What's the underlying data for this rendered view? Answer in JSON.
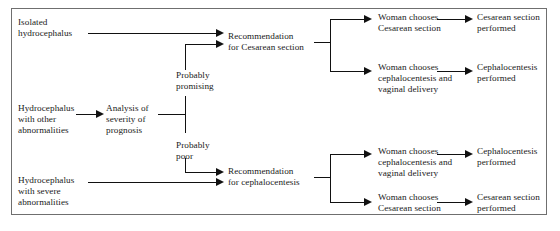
{
  "figure": {
    "type": "flowchart",
    "orientation": "left-to-right",
    "border_color": "#6f6f6f",
    "line_color": "#111111",
    "text_color": "#1a1a1a"
  },
  "nodes": {
    "isolated_hydrocephalus": "Isolated\nhydrocephalus",
    "hydrocephalus_other": "Hydrocephalus\nwith other\nabnormalities",
    "hydrocephalus_severe": "Hydrocephalus\nwith severe\nabnormalities",
    "analysis_severity": "Analysis of\nseverity of\nprognosis",
    "probably_promising": "Probably\npromising",
    "probably_poor": "Probably\npoor",
    "rec_cesarean": "Recommendation\nfor Cesarean section",
    "rec_cephalocentesis": "Recommendation\nfor cephalocentesis",
    "choice_top_cesarean": "Woman chooses\nCesarean section",
    "choice_top_cephalo": "Woman chooses\ncephalocentesis and\nvaginal delivery",
    "choice_bottom_cephalo": "Woman chooses\ncephalocentesis and\nvaginal delivery",
    "choice_bottom_cesarean": "Woman chooses\nCesarean section",
    "outcome_top_cesarean": "Cesarean section\nperformed",
    "outcome_top_cephalo": "Cephalocentesis\nperformed",
    "outcome_bottom_cephalo": "Cephalocentesis\nperformed",
    "outcome_bottom_cesarean": "Cesarean section\nperformed"
  }
}
